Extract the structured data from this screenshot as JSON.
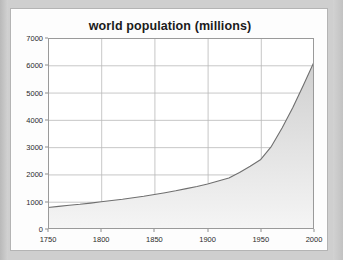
{
  "chart_data": {
    "type": "area",
    "title": "world population (millions)",
    "xlabel": "",
    "ylabel": "",
    "x": [
      1750,
      1760,
      1770,
      1780,
      1790,
      1800,
      1810,
      1820,
      1830,
      1840,
      1850,
      1860,
      1870,
      1880,
      1890,
      1900,
      1910,
      1920,
      1930,
      1940,
      1950,
      1960,
      1970,
      1980,
      1990,
      2000
    ],
    "values": [
      790,
      830,
      870,
      905,
      950,
      1000,
      1045,
      1090,
      1145,
      1200,
      1265,
      1330,
      1400,
      1480,
      1560,
      1650,
      1760,
      1870,
      2070,
      2300,
      2550,
      3030,
      3700,
      4440,
      5270,
      6120
    ],
    "series": [
      {
        "name": "world population",
        "values": [
          790,
          830,
          870,
          905,
          950,
          1000,
          1045,
          1090,
          1145,
          1200,
          1265,
          1330,
          1400,
          1480,
          1560,
          1650,
          1760,
          1870,
          2070,
          2300,
          2550,
          3030,
          3700,
          4440,
          5270,
          6120
        ]
      }
    ],
    "xlim": [
      1750,
      2000
    ],
    "ylim": [
      0,
      7000
    ],
    "xticks": [
      "1750",
      "1800",
      "1850",
      "1900",
      "1950",
      "2000"
    ],
    "xtick_values": [
      1750,
      1800,
      1850,
      1900,
      1950,
      2000
    ],
    "yticks": [
      "0",
      "1000",
      "2000",
      "3000",
      "4000",
      "5000",
      "6000",
      "7000"
    ],
    "ytick_values": [
      0,
      1000,
      2000,
      3000,
      4000,
      5000,
      6000,
      7000
    ],
    "grid": true,
    "legend": "none",
    "colors": {
      "area_fill_top": "#d0d0d0",
      "area_fill_bottom": "#f2f2f2",
      "line": "#6f6f6f",
      "grid": "#b9b9b9",
      "axis": "#8e8e8e",
      "title_text": "#1b1b1b",
      "tick_text": "#2a2a2a",
      "card_background": "#fdfdfd",
      "page_background": "#cfcfcf"
    }
  }
}
